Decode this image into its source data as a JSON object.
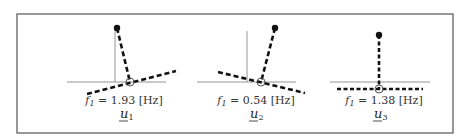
{
  "figure": {
    "frame": {
      "x": 17,
      "y": 14,
      "width": 436,
      "height": 119,
      "color": "#555555"
    },
    "panels": [
      {
        "id": "u1",
        "frequency_label": "f",
        "frequency_sub": "1",
        "frequency_value": " = 1.93 [Hz]",
        "mode_label": "u",
        "mode_sub": "1",
        "reference": {
          "vertical": [
            115,
            28,
            115,
            82
          ],
          "horizontal": [
            67,
            82,
            166,
            82
          ]
        },
        "pivot": [
          130,
          82
        ],
        "tip": [
          117,
          28
        ],
        "beam": [
          87,
          94,
          176,
          71
        ]
      },
      {
        "id": "u2",
        "frequency_label": "f",
        "frequency_sub": "1",
        "frequency_value": " = 0.54 [Hz]",
        "mode_label": "u",
        "mode_sub": "2",
        "reference": {
          "vertical": [
            247,
            31,
            247,
            82
          ],
          "horizontal": [
            197,
            82,
            296,
            82
          ]
        },
        "pivot": [
          261,
          82
        ],
        "tip": [
          275,
          28
        ],
        "beam": [
          218,
          72,
          305,
          93
        ]
      },
      {
        "id": "u3",
        "frequency_label": "f",
        "frequency_sub": "1",
        "frequency_value": " = 1.38 [Hz]",
        "mode_label": "u",
        "mode_sub": "3",
        "reference": {
          "vertical": null,
          "horizontal": [
            330,
            82,
            430,
            82
          ]
        },
        "pivot": [
          379,
          89
        ],
        "tip": [
          379,
          35
        ],
        "beam": [
          337,
          89,
          423,
          89
        ]
      }
    ]
  }
}
